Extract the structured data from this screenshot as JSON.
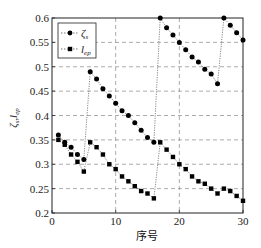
{
  "chart_data": {
    "type": "line",
    "title": "",
    "xlabel": "序号",
    "ylabel": "ζs, lep",
    "xlim": [
      0,
      30
    ],
    "ylim": [
      0.2,
      0.6
    ],
    "xticks": [
      0,
      10,
      20,
      30
    ],
    "yticks": [
      0.2,
      0.25,
      0.3,
      0.35,
      0.4,
      0.45,
      0.5,
      0.55,
      0.6
    ],
    "ytick_labels": [
      "0.2",
      "0.25",
      "0.3",
      "0.35",
      "0.4",
      "0.45",
      "0.5",
      "0.55",
      "0.6"
    ],
    "xtick_labels": [
      "0",
      "10",
      "20",
      "30"
    ],
    "grid": true,
    "legend_position": "upper left",
    "x": [
      1,
      2,
      3,
      4,
      5,
      6,
      7,
      8,
      9,
      10,
      11,
      12,
      13,
      14,
      15,
      16,
      17,
      18,
      19,
      20,
      21,
      22,
      23,
      24,
      25,
      26,
      27,
      28,
      29,
      30
    ],
    "series": [
      {
        "name": "ζs",
        "marker": "circle",
        "values": [
          0.36,
          0.345,
          0.335,
          0.32,
          0.31,
          0.49,
          0.475,
          0.455,
          0.44,
          0.425,
          0.41,
          0.4,
          0.385,
          0.37,
          0.355,
          0.345,
          0.6,
          0.58,
          0.565,
          0.55,
          0.535,
          0.52,
          0.51,
          0.495,
          0.485,
          0.465,
          0.6,
          0.585,
          0.57,
          0.555
        ]
      },
      {
        "name": "lep",
        "marker": "square",
        "values": [
          0.35,
          0.34,
          0.32,
          0.305,
          0.285,
          0.345,
          0.335,
          0.32,
          0.3,
          0.29,
          0.275,
          0.265,
          0.255,
          0.245,
          0.24,
          0.23,
          0.345,
          0.33,
          0.315,
          0.3,
          0.29,
          0.275,
          0.265,
          0.26,
          0.25,
          0.24,
          0.25,
          0.245,
          0.235,
          0.225
        ]
      }
    ]
  },
  "legend": {
    "items": [
      {
        "label_main": "ζ",
        "label_sub": "s"
      },
      {
        "label_main": "l",
        "label_sub": "ep"
      }
    ]
  },
  "axes": {
    "xlabel": "序号",
    "ylabel_main_1": "ζ",
    "ylabel_sub_1": "s",
    "ylabel_sep": ",",
    "ylabel_main_2": "l",
    "ylabel_sub_2": "ep"
  },
  "colors": {
    "line": "#555555",
    "marker": "#000000",
    "grid": "#888888",
    "axis": "#222222"
  }
}
